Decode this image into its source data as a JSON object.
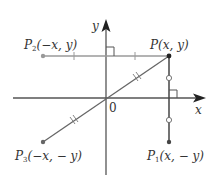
{
  "diagram": {
    "axes": {
      "x_label": "x",
      "y_label": "y",
      "origin_label": "0"
    },
    "points": {
      "P": {
        "name": "P",
        "sub": "",
        "coords": "(x, y)"
      },
      "P1": {
        "name": "P",
        "sub": "1",
        "coords": "(x, − y)"
      },
      "P2": {
        "name": "P",
        "sub": "2",
        "coords": "(−x, y)"
      },
      "P3": {
        "name": "P",
        "sub": "3",
        "coords": "(−x, − y)"
      }
    },
    "colors": {
      "axis": "#555555",
      "segment_p2": "#999999",
      "segment_p3": "#666666",
      "segment_p1": "#444444",
      "point": "#222222"
    }
  }
}
